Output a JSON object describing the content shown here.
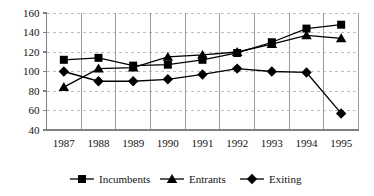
{
  "chart_data": {
    "type": "line",
    "title": "",
    "subtitle": "",
    "xlabel": "",
    "ylabel": "",
    "categories": [
      "1987",
      "1988",
      "1989",
      "1990",
      "1991",
      "1992",
      "1993",
      "1994",
      "1995"
    ],
    "series": [
      {
        "name": "Incumbents",
        "marker": "square",
        "color": "#000000",
        "values": [
          112,
          114,
          106,
          107,
          112,
          119,
          130,
          144,
          148
        ]
      },
      {
        "name": "Entrants",
        "marker": "triangle",
        "color": "#000000",
        "values": [
          84,
          103,
          104,
          115,
          117,
          120,
          128,
          137,
          134
        ]
      },
      {
        "name": "Exiting",
        "marker": "diamond",
        "color": "#000000",
        "values": [
          100,
          90,
          90,
          92,
          97,
          103,
          100,
          99,
          57
        ]
      }
    ],
    "ylim": [
      40,
      160
    ],
    "yticks": [
      40,
      60,
      80,
      100,
      120,
      140,
      160
    ],
    "ytick_labels": [
      "40",
      "60",
      "80",
      "100",
      "120",
      "140",
      "160"
    ],
    "grid": {
      "horizontal": true,
      "horizontal_style": "dashed",
      "horizontal_color": "#bfbfbf",
      "vertical": true,
      "vertical_style": "solid",
      "vertical_color": "#9a9a9a"
    },
    "axis_color": "#808080",
    "legend": {
      "position": "bottom",
      "entries": [
        {
          "label": "Incumbents",
          "marker": "square"
        },
        {
          "label": "Entrants",
          "marker": "triangle"
        },
        {
          "label": "Exiting",
          "marker": "diamond"
        }
      ]
    }
  }
}
